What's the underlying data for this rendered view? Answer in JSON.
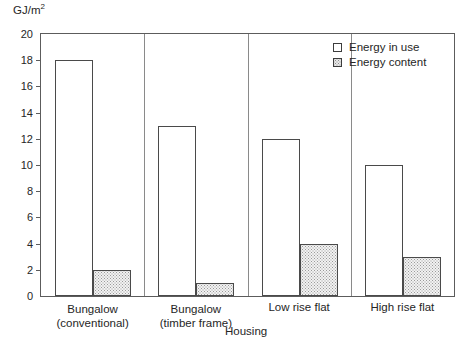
{
  "chart_data": {
    "type": "bar",
    "title": "",
    "subtitle": "",
    "xlabel": "Housing",
    "ylabel": "GJ/m2",
    "ylabel_display": "GJ/m",
    "ylabel_superscript": "2",
    "categories": [
      "Bungalow (conventional)",
      "Bungalow (timber frame)",
      "Low rise flat",
      "High rise flat"
    ],
    "category_lines": [
      [
        "Bungalow",
        "(conventional)"
      ],
      [
        "Bungalow",
        "(timber frame)"
      ],
      [
        "Low rise flat",
        ""
      ],
      [
        "High rise flat",
        ""
      ]
    ],
    "series": [
      {
        "name": "Energy in use",
        "fill": "white",
        "values": [
          18,
          13,
          12,
          10
        ]
      },
      {
        "name": "Energy content",
        "fill": "stippled",
        "values": [
          2,
          1,
          4,
          3
        ]
      }
    ],
    "ylim": [
      0,
      20
    ],
    "ytick_step": 2,
    "yticks": [
      0,
      2,
      4,
      6,
      8,
      10,
      12,
      14,
      16,
      18,
      20
    ],
    "ytick_labels": [
      "0",
      "2",
      "4",
      "6",
      "8",
      "10",
      "12",
      "14",
      "16",
      "18",
      "20"
    ],
    "xlim_categories": 4,
    "grid": false,
    "legend_position": "top-right",
    "legend_entries": [
      "Energy in use",
      "Energy content"
    ],
    "axis_color": "#5c5c5c",
    "bar_border_color": "#4a4a4a",
    "text_color": "#262626"
  }
}
